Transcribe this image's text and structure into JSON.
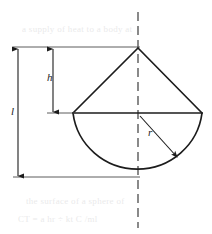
{
  "figure": {
    "stroke_color": "#1c1c1c",
    "background_color": "#ffffff",
    "centerline_style": "dashed"
  },
  "labels": {
    "total_length": "l",
    "cone_height": "h",
    "radius": "r"
  },
  "geometry": {
    "apex": {
      "x": 138,
      "y": 48
    },
    "center": {
      "x": 138,
      "y": 113
    },
    "left_vertex": {
      "x": 73,
      "y": 113
    },
    "right_vertex": {
      "x": 202,
      "y": 113
    },
    "semicircle_bottom": {
      "x": 138,
      "y": 177
    },
    "radius_px": 64,
    "centerline_x": 138,
    "centerline_top_y": 12,
    "centerline_bottom_y": 228,
    "dim_l_x": 18,
    "dim_h_x": 53,
    "radius_arrow_end": {
      "x": 178,
      "y": 158
    }
  },
  "background_text": {
    "line1": "a supply of heat to a body at",
    "line2": "the surface of a sphere of",
    "line3": "CT = a hr ÷ kt C /ml"
  }
}
